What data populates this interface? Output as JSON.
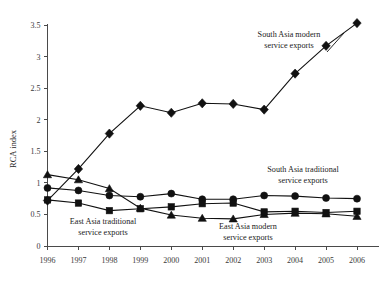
{
  "chart_data": {
    "type": "line",
    "title": "",
    "xlabel": "",
    "ylabel": "RCA index",
    "x": [
      "1996",
      "1997",
      "1998",
      "1999",
      "2000",
      "2001",
      "2002",
      "2003",
      "2004",
      "2005",
      "2006"
    ],
    "xlim": [
      1996,
      2006
    ],
    "ylim": [
      0,
      3.5
    ],
    "yticks": [
      "0",
      "0.5",
      "1",
      "1.5",
      "2",
      "2.5",
      "3",
      "3.5"
    ],
    "ytick_values": [
      0,
      0.5,
      1,
      1.5,
      2,
      2.5,
      3,
      3.5
    ],
    "grid": false,
    "legend": "inline-annotations",
    "series": [
      {
        "name": "South Asia modern service exports",
        "marker": "diamond",
        "values": [
          0.72,
          1.22,
          1.78,
          2.22,
          2.11,
          2.26,
          2.25,
          2.16,
          2.73,
          3.17,
          3.53
        ]
      },
      {
        "name": "East Asia traditional service exports",
        "marker": "triangle",
        "values": [
          1.13,
          1.05,
          0.91,
          0.6,
          0.49,
          0.44,
          0.43,
          0.5,
          0.52,
          0.51,
          0.47
        ]
      },
      {
        "name": "South Asia traditional service exports",
        "marker": "circle",
        "values": [
          0.92,
          0.88,
          0.8,
          0.78,
          0.83,
          0.74,
          0.74,
          0.8,
          0.79,
          0.76,
          0.75
        ]
      },
      {
        "name": "East Asia modern service exports",
        "marker": "square",
        "values": [
          0.73,
          0.68,
          0.56,
          0.59,
          0.62,
          0.67,
          0.68,
          0.54,
          0.55,
          0.53,
          0.55
        ]
      }
    ],
    "annotations": [
      {
        "id": "south-asia-modern",
        "line1": "South Asia modern",
        "line2": "service exports"
      },
      {
        "id": "south-asia-traditional",
        "line1": "South Asia traditional",
        "line2": "service exports"
      },
      {
        "id": "east-asia-traditional",
        "line1": "East Asia traditional",
        "line2": "service exports"
      },
      {
        "id": "east-asia-modern",
        "line1": "East Asia modern",
        "line2": "service exports"
      }
    ],
    "colors": {
      "ink": "#111111",
      "axis": "#4a4a4a",
      "background": "#ffffff"
    }
  }
}
